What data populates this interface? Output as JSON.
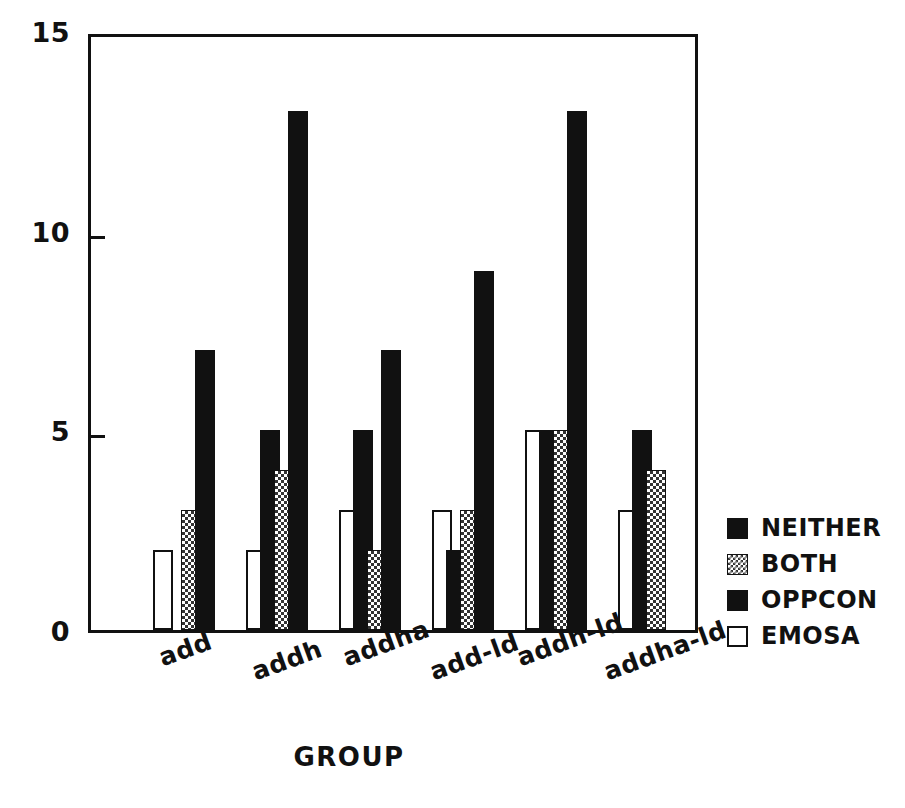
{
  "chart_data": {
    "type": "bar",
    "title": "",
    "xlabel": "GROUP",
    "ylabel": "",
    "ylim": [
      0,
      15
    ],
    "yticks": [
      0,
      5,
      10,
      15
    ],
    "grid": false,
    "legend_position": "right",
    "grouping": "grouped",
    "categories": [
      "add",
      "addh",
      "addha",
      "add-ld",
      "addh-ld",
      "addha-ld"
    ],
    "series": [
      {
        "name": "NEITHER",
        "fill": "solid-black",
        "color": "#111111",
        "values": [
          0,
          5,
          5,
          2,
          5,
          5
        ]
      },
      {
        "name": "BOTH",
        "fill": "checkered",
        "color": "#333333",
        "values": [
          3,
          4,
          2,
          3,
          5,
          4
        ]
      },
      {
        "name": "OPPCON",
        "fill": "solid-black",
        "color": "#111111",
        "values": [
          7,
          13,
          7,
          9,
          13,
          0
        ]
      },
      {
        "name": "EMOSA",
        "fill": "white-outline",
        "color": "#ffffff",
        "values": [
          2,
          2,
          3,
          3,
          5,
          3
        ]
      }
    ]
  },
  "axis": {
    "y_tick_labels": [
      "15",
      "10",
      "5",
      "0"
    ],
    "x_title": "GROUP"
  },
  "legend": {
    "entries": [
      {
        "label": "NEITHER",
        "style": "s-neither"
      },
      {
        "label": "BOTH",
        "style": "s-both"
      },
      {
        "label": "OPPCON",
        "style": "s-oppcon"
      },
      {
        "label": "EMOSA",
        "style": "s-emosa"
      }
    ]
  },
  "colors": {
    "axis": "#111111",
    "background": "#ffffff",
    "bar_solid": "#111111",
    "bar_pattern": "#333333",
    "bar_open": "#ffffff"
  }
}
